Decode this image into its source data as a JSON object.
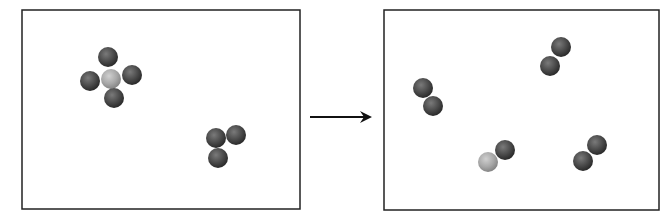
{
  "diagram": {
    "colors": {
      "dark_atom": "#4a4a4a",
      "light_atom": "#a8a8a8",
      "frame": "#222222",
      "arrow": "#111111"
    },
    "panels": [
      {
        "name": "reactants",
        "frame": {
          "x": 22,
          "y": 10,
          "w": 278,
          "h": 199
        },
        "atoms": [
          {
            "cx": 108,
            "cy": 57,
            "type": "dark"
          },
          {
            "cx": 90,
            "cy": 81,
            "type": "dark"
          },
          {
            "cx": 132,
            "cy": 75,
            "type": "dark"
          },
          {
            "cx": 114,
            "cy": 98,
            "type": "dark"
          },
          {
            "cx": 111,
            "cy": 79,
            "type": "light"
          },
          {
            "cx": 216,
            "cy": 138,
            "type": "dark"
          },
          {
            "cx": 236,
            "cy": 135,
            "type": "dark"
          },
          {
            "cx": 218,
            "cy": 158,
            "type": "dark"
          }
        ]
      },
      {
        "name": "products",
        "frame": {
          "x": 384,
          "y": 10,
          "w": 275,
          "h": 200
        },
        "atoms": [
          {
            "cx": 423,
            "cy": 88,
            "type": "dark"
          },
          {
            "cx": 433,
            "cy": 106,
            "type": "dark"
          },
          {
            "cx": 561,
            "cy": 47,
            "type": "dark"
          },
          {
            "cx": 550,
            "cy": 66,
            "type": "dark"
          },
          {
            "cx": 505,
            "cy": 150,
            "type": "dark"
          },
          {
            "cx": 488,
            "cy": 162,
            "type": "light"
          },
          {
            "cx": 597,
            "cy": 145,
            "type": "dark"
          },
          {
            "cx": 583,
            "cy": 161,
            "type": "dark"
          }
        ]
      }
    ],
    "arrow": {
      "x1": 310,
      "y1": 117,
      "x2": 372,
      "y2": 117
    }
  }
}
